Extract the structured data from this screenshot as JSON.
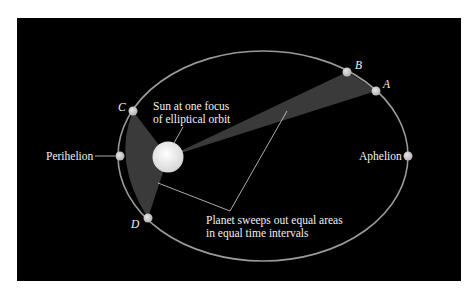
{
  "diagram": {
    "colors": {
      "background": "#000000",
      "orbit": "#9a9a9a",
      "swept_area": "#3a3a3a",
      "planet": "#cfcfcf",
      "sun": "#f4f4f4",
      "text": "#f2f2f2",
      "leader_line": "#d8d8d8"
    },
    "points": {
      "A": {
        "label": "A"
      },
      "B": {
        "label": "B"
      },
      "C": {
        "label": "C"
      },
      "D": {
        "label": "D"
      }
    },
    "labels": {
      "perihelion": "Perihelion",
      "aphelion": "Aphelion",
      "sun_line1": "Sun at one focus",
      "sun_line2": "of elliptical orbit",
      "areas_line1": "Planet sweeps out equal areas",
      "areas_line2": "in equal time intervals"
    }
  }
}
